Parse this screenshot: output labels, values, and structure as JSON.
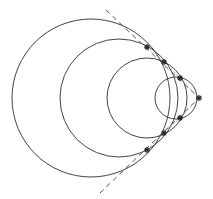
{
  "diagram": {
    "stroke_color": "#444444",
    "background": "#ffffff",
    "circles": [
      {
        "id": "circle-1",
        "cx": 91,
        "cy": 98,
        "r": 79
      },
      {
        "id": "circle-2",
        "cx": 119,
        "cy": 98,
        "r": 59
      },
      {
        "id": "circle-3",
        "cx": 147,
        "cy": 98,
        "r": 40
      },
      {
        "id": "circle-4",
        "cx": 176,
        "cy": 98,
        "r": 21
      }
    ],
    "tangent_lines": [
      {
        "id": "upper-tangent",
        "x1": 106,
        "y1": 10,
        "x2": 199,
        "y2": 98
      },
      {
        "id": "lower-tangent",
        "x1": 100,
        "y1": 193,
        "x2": 199,
        "y2": 98
      }
    ],
    "markers": [
      {
        "id": "marker-upper-1",
        "x": 147,
        "y": 47
      },
      {
        "id": "marker-upper-2",
        "x": 164,
        "y": 62
      },
      {
        "id": "marker-upper-3",
        "x": 180,
        "y": 78
      },
      {
        "id": "marker-apex",
        "x": 199,
        "y": 98
      },
      {
        "id": "marker-lower-3",
        "x": 180,
        "y": 118
      },
      {
        "id": "marker-lower-2",
        "x": 164,
        "y": 133
      },
      {
        "id": "marker-lower-1",
        "x": 147,
        "y": 150
      }
    ]
  }
}
